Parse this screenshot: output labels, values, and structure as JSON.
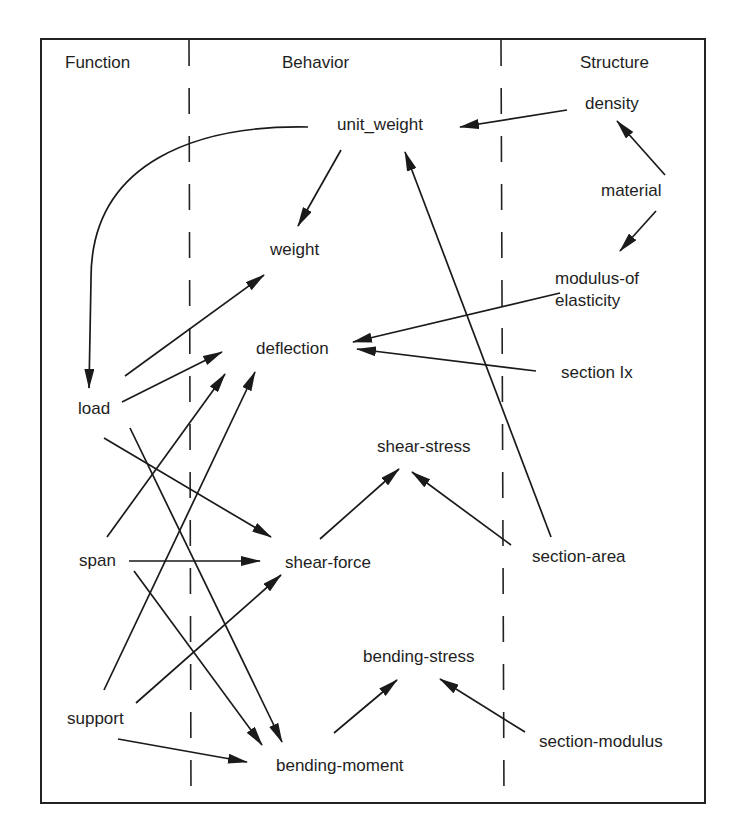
{
  "columns": {
    "function": "Function",
    "behavior": "Behavior",
    "structure": "Structure"
  },
  "nodes": {
    "unit_weight": "unit_weight",
    "density": "density",
    "material": "material",
    "weight": "weight",
    "modulus": "modulus-of",
    "modulus2": "elasticity",
    "deflection": "deflection",
    "section_ix": "section Ix",
    "load": "load",
    "shear_stress": "shear-stress",
    "span": "span",
    "shear_force": "shear-force",
    "section_area": "section-area",
    "bending_stress": "bending-stress",
    "support": "support",
    "section_modulus": "section-modulus",
    "bending_moment": "bending-moment"
  },
  "edges": [
    {
      "from": "density",
      "to": "unit_weight"
    },
    {
      "from": "material",
      "to": "density"
    },
    {
      "from": "material",
      "to": "modulus-of elasticity"
    },
    {
      "from": "unit_weight",
      "to": "weight"
    },
    {
      "from": "unit_weight",
      "to": "load"
    },
    {
      "from": "modulus-of elasticity",
      "to": "deflection"
    },
    {
      "from": "section Ix",
      "to": "deflection"
    },
    {
      "from": "section-area",
      "to": "unit_weight"
    },
    {
      "from": "section-area",
      "to": "shear-stress"
    },
    {
      "from": "load",
      "to": "weight"
    },
    {
      "from": "load",
      "to": "deflection"
    },
    {
      "from": "load",
      "to": "shear-force"
    },
    {
      "from": "load",
      "to": "bending-moment"
    },
    {
      "from": "span",
      "to": "deflection"
    },
    {
      "from": "span",
      "to": "shear-force"
    },
    {
      "from": "span",
      "to": "bending-moment"
    },
    {
      "from": "support",
      "to": "deflection"
    },
    {
      "from": "support",
      "to": "shear-force"
    },
    {
      "from": "support",
      "to": "bending-moment"
    },
    {
      "from": "shear-force",
      "to": "shear-stress"
    },
    {
      "from": "bending-moment",
      "to": "bending-stress"
    },
    {
      "from": "section-modulus",
      "to": "bending-stress"
    }
  ]
}
